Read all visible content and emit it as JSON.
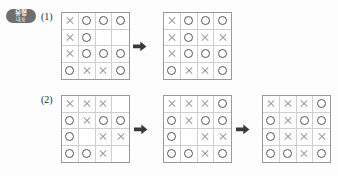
{
  "badge": {
    "line1": "유형",
    "line2": "대표"
  },
  "items": [
    {
      "number": "(1)",
      "grids": [
        {
          "name": "grid-1-1",
          "rows": [
            [
              "X",
              "O",
              "O",
              "O"
            ],
            [
              "X",
              "O",
              "",
              ""
            ],
            [
              "X",
              "O",
              "O",
              "O"
            ],
            [
              "O",
              "X",
              "X",
              "O"
            ]
          ]
        },
        {
          "name": "grid-1-2",
          "rows": [
            [
              "X",
              "O",
              "O",
              "O"
            ],
            [
              "X",
              "O",
              "X",
              "X"
            ],
            [
              "X",
              "O",
              "O",
              "O"
            ],
            [
              "O",
              "X",
              "X",
              "O"
            ]
          ]
        }
      ],
      "arrows": [
        "arrow-right"
      ]
    },
    {
      "number": "(2)",
      "grids": [
        {
          "name": "grid-2-1",
          "rows": [
            [
              "X",
              "X",
              "X",
              ""
            ],
            [
              "O",
              "X",
              "O",
              "O"
            ],
            [
              "O",
              "",
              "X",
              "X"
            ],
            [
              "O",
              "O",
              "X",
              ""
            ]
          ]
        },
        {
          "name": "grid-2-2",
          "rows": [
            [
              "X",
              "X",
              "X",
              "O"
            ],
            [
              "O",
              "X",
              "O",
              "O"
            ],
            [
              "O",
              "",
              "X",
              "X"
            ],
            [
              "O",
              "O",
              "X",
              "O"
            ]
          ]
        },
        {
          "name": "grid-2-3",
          "rows": [
            [
              "X",
              "X",
              "X",
              "O"
            ],
            [
              "O",
              "X",
              "O",
              "O"
            ],
            [
              "O",
              "X",
              "X",
              "X"
            ],
            [
              "O",
              "O",
              "X",
              "O"
            ]
          ]
        }
      ],
      "arrows": [
        "arrow-right",
        "arrow-right"
      ]
    }
  ],
  "colors": {
    "badge_bg": "#6e6e70",
    "grid_border": "#9a9a9a",
    "grid_inner": "#cfcfcf",
    "mark_o": "#55555a",
    "mark_x": "#9b9ba0",
    "arrow": "#3a3a3a",
    "page_bg": "#fdfdfd"
  }
}
